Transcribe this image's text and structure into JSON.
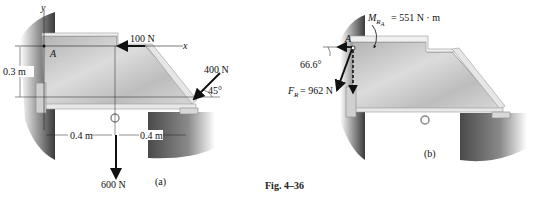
{
  "figure": {
    "caption": "Fig. 4–36",
    "panel_a": {
      "label": "(a)",
      "axis_y": "y",
      "axis_x": "x",
      "point": "A",
      "force_top": "100 N",
      "force_right": "400 N",
      "force_right_angle": "45°",
      "force_down": "600 N",
      "height_dim": "0.3 m",
      "width_dim_left": "0.4 m",
      "width_dim_right": "0.4 m"
    },
    "panel_b": {
      "label": "(b)",
      "point": "A",
      "moment_label": "M",
      "moment_sub": "R",
      "moment_subsub": "A",
      "moment_value": "= 551 N · m",
      "resultant_label": "F",
      "resultant_sub": "R",
      "resultant_value": "= 962 N",
      "resultant_angle": "66.6°"
    },
    "colors": {
      "arrow": "#111111",
      "plate": "#c8c8c8",
      "wall": "#555555"
    }
  }
}
